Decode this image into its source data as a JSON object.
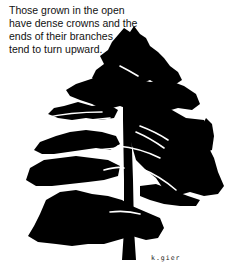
{
  "caption": {
    "lines": [
      "Those grown in the open",
      "have dense crowns and the",
      "ends of their branches",
      "tend to turn upward."
    ]
  },
  "illustration": {
    "subject": "pine-tree-silhouette",
    "fill_color": "#000000",
    "background_color": "#ffffff"
  },
  "signature": "k.gier"
}
